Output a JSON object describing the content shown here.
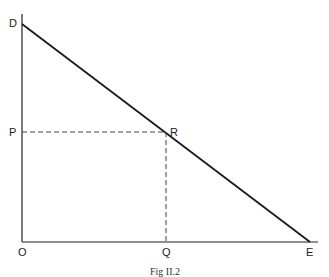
{
  "diagram": {
    "labels": {
      "D": "D",
      "P": "P",
      "R": "R",
      "O": "O",
      "Q": "Q",
      "E": "E"
    },
    "caption": "Fig II.2",
    "points": {
      "D": [
        22,
        24
      ],
      "R": [
        166,
        132
      ],
      "E": [
        310,
        242
      ],
      "O": [
        22,
        242
      ],
      "P": [
        22,
        132
      ],
      "Q": [
        166,
        242
      ]
    },
    "colors": {
      "line": "#1a1a1a",
      "dash": "#444444"
    }
  }
}
